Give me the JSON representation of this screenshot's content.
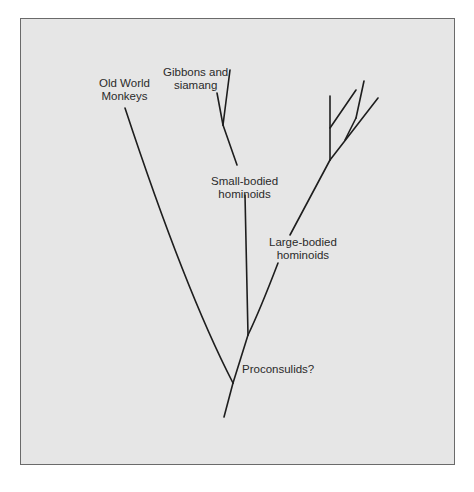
{
  "diagram": {
    "type": "phylogenetic-tree",
    "labels": {
      "old_world_monkeys": [
        "Old World",
        "Monkeys"
      ],
      "gibbons": [
        "Gibbons and",
        "siamang"
      ],
      "small_bodied": [
        "Small-bodied",
        "hominoids"
      ],
      "large_bodied": [
        "Large-bodied",
        "hominoids"
      ],
      "proconsulids": "Proconsulids?"
    },
    "colors": {
      "background": "#e6e6e6",
      "line": "#1e1e1e",
      "border": "#6a6a6a"
    }
  }
}
